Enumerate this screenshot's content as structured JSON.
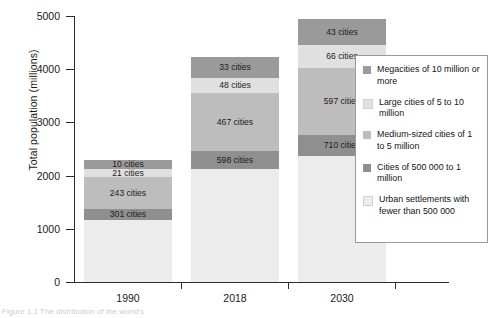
{
  "chart_data": {
    "type": "bar",
    "subtype": "stacked-bar",
    "title": "",
    "xlabel": "",
    "ylabel": "Total population (millions)",
    "categories": [
      "1990",
      "2018",
      "2030"
    ],
    "ylim": [
      0,
      5000
    ],
    "yticks": [
      0,
      1000,
      2000,
      3000,
      4000,
      5000
    ],
    "ytick_labels": [
      "0",
      "1000",
      "2000",
      "3000",
      "4000",
      "5000"
    ],
    "grid": false,
    "legend_position": "right",
    "stack_order": "bottom-to-top",
    "series": [
      {
        "name": "Urban settlements with fewer than 500 000",
        "color": "#ececec",
        "values": [
          1160,
          2130,
          2370
        ],
        "labels": [
          "",
          "",
          ""
        ]
      },
      {
        "name": "Cities of 500 000 to 1 million",
        "color": "#8f8f8f",
        "values": [
          210,
          330,
          390
        ],
        "labels": [
          "301 cities",
          "598 cities",
          "710 cities"
        ]
      },
      {
        "name": "Medium-sized cities of 1 to 5 million",
        "color": "#bdbdbd",
        "values": [
          610,
          1090,
          1270
        ],
        "labels": [
          "243 cities",
          "467 cities",
          "597 cities"
        ]
      },
      {
        "name": "Large cities of 5 to 10 million",
        "color": "#e0e0e0",
        "values": [
          140,
          290,
          420
        ],
        "labels": [
          "21 cities",
          "48 cities",
          "66 cities"
        ]
      },
      {
        "name": "Megacities of 10 million or more",
        "color": "#9a9a9a",
        "values": [
          170,
          380,
          500
        ],
        "labels": [
          "10 cities",
          "33 cities",
          "43 cities"
        ]
      }
    ],
    "totals": [
      2290,
      4220,
      4950
    ]
  },
  "axes": {
    "y_title": "Total population (millions)",
    "y_ticks": [
      {
        "label": "5000",
        "value": 5000
      },
      {
        "label": "4000",
        "value": 4000
      },
      {
        "label": "3000",
        "value": 3000
      },
      {
        "label": "2000",
        "value": 2000
      },
      {
        "label": "1000",
        "value": 1000
      },
      {
        "label": "0",
        "value": 0
      }
    ],
    "x_ticks": [
      {
        "label": "1990"
      },
      {
        "label": "2018"
      },
      {
        "label": "2030"
      }
    ]
  },
  "legend": {
    "items": [
      {
        "label": "Megacities of 10 million or more",
        "color": "#9a9a9a"
      },
      {
        "label": "Large cities of 5 to 10 million",
        "color": "#e0e0e0"
      },
      {
        "label": "Medium-sized cities of 1 to 5 million",
        "color": "#bdbdbd"
      },
      {
        "label": "Cities of 500 000 to 1 million",
        "color": "#8f8f8f"
      },
      {
        "label": "Urban settlements with fewer than 500 000",
        "color": "#ececec"
      }
    ]
  },
  "caption": {
    "text": "Figure 1.1  The distribution of the world's"
  },
  "bar_labels": {
    "1990": [
      "10 cities",
      "21 cities",
      "243 cities",
      "301 cities"
    ],
    "2018": [
      "33 cities",
      "48 cities",
      "467 cities",
      "598 cities"
    ],
    "2030": [
      "43 cities",
      "66 cities",
      "597 cities",
      "710 cities"
    ]
  }
}
